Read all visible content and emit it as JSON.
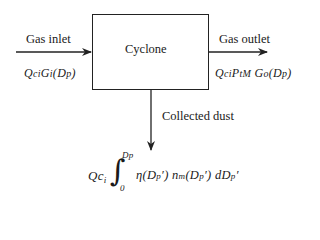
{
  "diagram": {
    "box_label": "Cyclone",
    "inlet": {
      "label": "Gas inlet",
      "formula": "QciGi(Dp)"
    },
    "outlet": {
      "label": "Gas outlet",
      "formula": "QciPtM Go(Dp)"
    },
    "dust": {
      "label": "Collected dust",
      "formula_prefix": "Qci",
      "integral_upper": "Dp",
      "integral_lower": "0",
      "integrand": "η(Dp′) nm(Dp′) dDp′"
    }
  }
}
